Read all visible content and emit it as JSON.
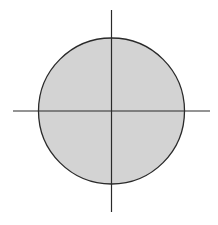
{
  "diagram": {
    "type": "circle-with-axes",
    "circle": {
      "cx": 111.5,
      "cy": 111,
      "r": 73,
      "fill": "#d3d3d3",
      "stroke": "#2a2a2a",
      "stroke_width": 1.3
    },
    "horizontal_axis": {
      "x1": 13,
      "y1": 111,
      "x2": 210,
      "y2": 111,
      "stroke": "#2a2a2a",
      "stroke_width": 1.2
    },
    "vertical_axis": {
      "x1": 111.5,
      "y1": 10,
      "x2": 111.5,
      "y2": 212,
      "stroke": "#2a2a2a",
      "stroke_width": 1.2
    }
  }
}
